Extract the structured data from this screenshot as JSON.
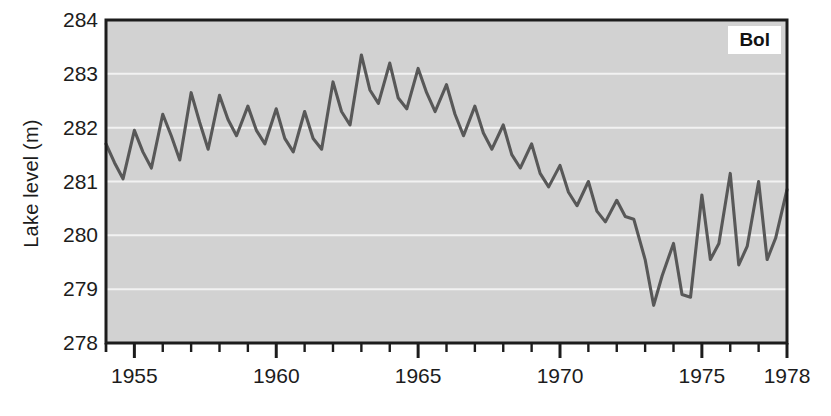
{
  "chart_data": {
    "type": "line",
    "title": "",
    "subtitle": "",
    "xlabel": "",
    "ylabel": "Lake level (m)",
    "xlim": [
      1954.0,
      1978.0
    ],
    "ylim": [
      278,
      284
    ],
    "ytick_labels": [
      "284",
      "283",
      "282",
      "281",
      "280",
      "279",
      "278"
    ],
    "ytick_values": [
      284,
      283,
      282,
      281,
      280,
      279,
      278
    ],
    "xtick_labels": [
      "1955",
      "1960",
      "1965",
      "1970",
      "1975",
      "1978"
    ],
    "xtick_values": [
      1955,
      1960,
      1965,
      1970,
      1975,
      1978
    ],
    "xtick_minor_step": 1,
    "grid": "horizontal-white",
    "plot_background": "#d2d2d2",
    "line_color": "#585858",
    "legend_position": "top-right",
    "legend_entries": [
      "Bol"
    ],
    "series": [
      {
        "name": "Bol",
        "units": "m",
        "x": [
          1954.0,
          1954.3,
          1954.6,
          1955.0,
          1955.3,
          1955.6,
          1956.0,
          1956.3,
          1956.6,
          1957.0,
          1957.3,
          1957.6,
          1958.0,
          1958.3,
          1958.6,
          1959.0,
          1959.3,
          1959.6,
          1960.0,
          1960.3,
          1960.6,
          1961.0,
          1961.3,
          1961.6,
          1962.0,
          1962.3,
          1962.6,
          1963.0,
          1963.3,
          1963.6,
          1964.0,
          1964.3,
          1964.6,
          1965.0,
          1965.3,
          1965.6,
          1966.0,
          1966.3,
          1966.6,
          1967.0,
          1967.3,
          1967.6,
          1968.0,
          1968.3,
          1968.6,
          1969.0,
          1969.3,
          1969.6,
          1970.0,
          1970.3,
          1970.6,
          1971.0,
          1971.3,
          1971.6,
          1972.0,
          1972.3,
          1972.6,
          1973.0,
          1973.3,
          1973.6,
          1974.0,
          1974.3,
          1974.6,
          1975.0,
          1975.3,
          1975.6,
          1976.0,
          1976.3,
          1976.6,
          1977.0,
          1977.3,
          1977.6,
          1978.0
        ],
        "y": [
          281.7,
          281.35,
          281.05,
          281.95,
          281.55,
          281.25,
          282.25,
          281.85,
          281.4,
          282.65,
          282.1,
          281.6,
          282.6,
          282.15,
          281.85,
          282.4,
          281.95,
          281.7,
          282.35,
          281.8,
          281.55,
          282.3,
          281.8,
          281.6,
          282.85,
          282.3,
          282.05,
          283.35,
          282.7,
          282.45,
          283.2,
          282.55,
          282.35,
          283.1,
          282.65,
          282.3,
          282.8,
          282.25,
          281.85,
          282.4,
          281.9,
          281.6,
          282.05,
          281.5,
          281.25,
          281.7,
          281.15,
          280.9,
          281.3,
          280.8,
          280.55,
          281.0,
          280.45,
          280.25,
          280.65,
          280.35,
          280.3,
          279.55,
          278.7,
          279.25,
          279.85,
          278.9,
          278.85,
          280.75,
          279.55,
          279.85,
          281.15,
          279.45,
          279.8,
          281.0,
          279.55,
          279.95,
          280.85
        ]
      }
    ]
  }
}
